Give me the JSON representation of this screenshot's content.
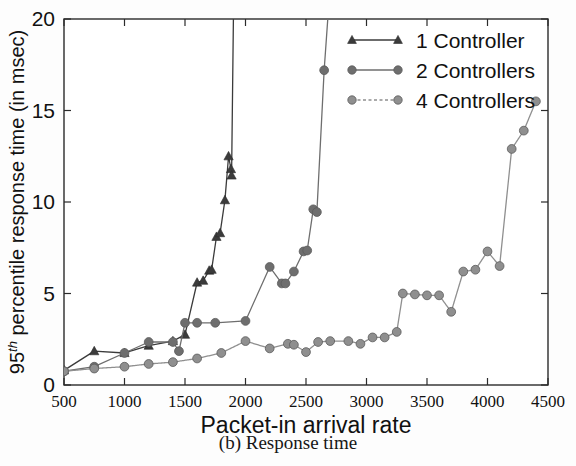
{
  "figure": {
    "caption": "(b) Response time"
  },
  "chart_data": {
    "type": "line",
    "title": "",
    "xlabel": "Packet-in arrival rate",
    "ylabel": "95th percentile response time (in msec)",
    "ylabel_parts": {
      "prefix": "95",
      "superscript": "th",
      "suffix": " percentile response time (in msec)"
    },
    "xlim": [
      500,
      4500
    ],
    "ylim": [
      0,
      20
    ],
    "xticks": [
      500,
      1000,
      1500,
      2000,
      2500,
      3000,
      3500,
      4000,
      4500
    ],
    "xticklabels": [
      "500",
      "1000",
      "1500",
      "2000",
      "2500",
      "3000",
      "3500",
      "4000",
      "4500"
    ],
    "yticks": [
      0,
      5,
      10,
      15,
      20
    ],
    "yticklabels": [
      "0",
      "5",
      "10",
      "15",
      "20"
    ],
    "grid": false,
    "legend_position": "top-right",
    "series": [
      {
        "name": "1 Controller",
        "marker": "triangle",
        "color": "#3b3b3b",
        "linestyle": "solid",
        "points": [
          [
            500,
            0.8
          ],
          [
            750,
            1.85
          ],
          [
            1000,
            1.75
          ],
          [
            1200,
            2.15
          ],
          [
            1400,
            2.4
          ],
          [
            1500,
            2.75
          ],
          [
            1600,
            5.6
          ],
          [
            1650,
            5.7
          ],
          [
            1700,
            6.25
          ],
          [
            1720,
            6.3
          ],
          [
            1760,
            8.1
          ],
          [
            1790,
            8.3
          ],
          [
            1830,
            10.1
          ],
          [
            1860,
            12.5
          ],
          [
            1880,
            11.8
          ],
          [
            1885,
            11.45
          ],
          [
            1900,
            20.0
          ]
        ]
      },
      {
        "name": "2 Controllers",
        "marker": "circle",
        "color": "#6e6e6e",
        "linestyle": "solid",
        "points": [
          [
            500,
            0.75
          ],
          [
            750,
            1.0
          ],
          [
            1000,
            1.75
          ],
          [
            1200,
            2.35
          ],
          [
            1400,
            2.35
          ],
          [
            1450,
            1.85
          ],
          [
            1500,
            3.4
          ],
          [
            1600,
            3.4
          ],
          [
            1750,
            3.4
          ],
          [
            2000,
            3.5
          ],
          [
            2200,
            6.45
          ],
          [
            2300,
            5.55
          ],
          [
            2330,
            5.55
          ],
          [
            2400,
            6.2
          ],
          [
            2480,
            7.3
          ],
          [
            2510,
            7.35
          ],
          [
            2560,
            9.6
          ],
          [
            2590,
            9.45
          ],
          [
            2650,
            17.2
          ],
          [
            2680,
            20.0
          ]
        ]
      },
      {
        "name": "4 Controllers",
        "marker": "circle",
        "color": "#8f8f8f",
        "linestyle": "dashed",
        "points": [
          [
            500,
            0.75
          ],
          [
            750,
            0.9
          ],
          [
            1000,
            1.0
          ],
          [
            1200,
            1.15
          ],
          [
            1400,
            1.25
          ],
          [
            1600,
            1.45
          ],
          [
            1800,
            1.75
          ],
          [
            2000,
            2.4
          ],
          [
            2200,
            2.0
          ],
          [
            2350,
            2.25
          ],
          [
            2400,
            2.2
          ],
          [
            2500,
            1.8
          ],
          [
            2600,
            2.35
          ],
          [
            2700,
            2.4
          ],
          [
            2850,
            2.4
          ],
          [
            2950,
            2.25
          ],
          [
            3050,
            2.6
          ],
          [
            3150,
            2.6
          ],
          [
            3250,
            2.9
          ],
          [
            3300,
            5.0
          ],
          [
            3400,
            4.95
          ],
          [
            3500,
            4.9
          ],
          [
            3600,
            4.9
          ],
          [
            3700,
            4.0
          ],
          [
            3800,
            6.2
          ],
          [
            3900,
            6.3
          ],
          [
            4000,
            7.3
          ],
          [
            4100,
            6.5
          ],
          [
            4200,
            12.9
          ],
          [
            4300,
            13.9
          ],
          [
            4400,
            15.5
          ]
        ]
      }
    ]
  }
}
